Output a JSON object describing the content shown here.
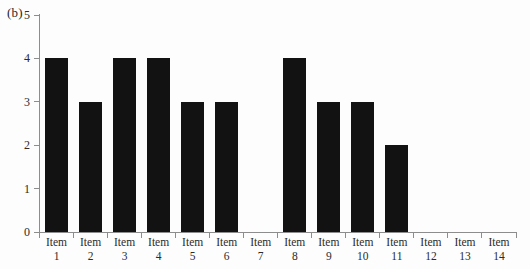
{
  "panel": {
    "label": "(b)"
  },
  "chart_data": {
    "type": "bar",
    "title": "",
    "subtitle": "",
    "panel_label": "(b)",
    "xlabel": "",
    "ylabel": "",
    "categories": [
      "Item 1",
      "Item 2",
      "Item 3",
      "Item 4",
      "Item 5",
      "Item 6",
      "Item 7",
      "Item 8",
      "Item 9",
      "Item 10",
      "Item 11",
      "Item 12",
      "Item 13",
      "Item 14"
    ],
    "category_lines": [
      {
        "line1": "Item",
        "line2": "1"
      },
      {
        "line1": "Item",
        "line2": "2"
      },
      {
        "line1": "Item",
        "line2": "3"
      },
      {
        "line1": "Item",
        "line2": "4"
      },
      {
        "line1": "Item",
        "line2": "5"
      },
      {
        "line1": "Item",
        "line2": "6"
      },
      {
        "line1": "Item",
        "line2": "7"
      },
      {
        "line1": "Item",
        "line2": "8"
      },
      {
        "line1": "Item",
        "line2": "9"
      },
      {
        "line1": "Item",
        "line2": "10"
      },
      {
        "line1": "Item",
        "line2": "11"
      },
      {
        "line1": "Item",
        "line2": "12"
      },
      {
        "line1": "Item",
        "line2": "13"
      },
      {
        "line1": "Item",
        "line2": "14"
      }
    ],
    "values": [
      4,
      3,
      4,
      4,
      3,
      3,
      0,
      4,
      3,
      3,
      2,
      0,
      0,
      0
    ],
    "ylim": [
      0,
      5
    ],
    "yticks": [
      0,
      1,
      2,
      3,
      4,
      5
    ],
    "ytick_labels": [
      "0",
      "1",
      "2",
      "3",
      "4",
      "5"
    ],
    "grid": false,
    "legend": null,
    "bar_color": "#121212",
    "axis_color": "#8d8d8d",
    "background_color": "#fdfdfd"
  }
}
